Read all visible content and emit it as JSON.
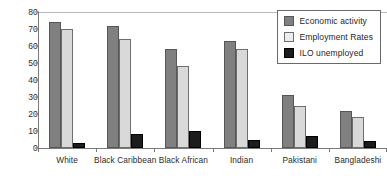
{
  "chart_data": {
    "type": "bar",
    "title": "",
    "xlabel": "",
    "ylabel": "Percentage",
    "ylim": [
      0,
      80
    ],
    "yticks": [
      0,
      10,
      20,
      30,
      40,
      50,
      60,
      70,
      80
    ],
    "grid": false,
    "legend_position": "top-right",
    "categories": [
      "White",
      "Black Caribbean",
      "Black African",
      "Indian",
      "Pakistani",
      "Bangladeshi"
    ],
    "series": [
      {
        "name": "Economic activity",
        "color": "#808080",
        "values": [
          74,
          72,
          58,
          63,
          31,
          22
        ]
      },
      {
        "name": "Employment Rates",
        "color": "#d9d9d9",
        "values": [
          70,
          64,
          48,
          58,
          25,
          18
        ]
      },
      {
        "name": "ILO unemployed",
        "color": "#1c1c1c",
        "values": [
          3,
          8,
          10,
          5,
          7,
          4
        ]
      }
    ]
  },
  "legend": {
    "items": [
      {
        "label": "Economic activity"
      },
      {
        "label": "Employment Rates"
      },
      {
        "label": "ILO unemployed"
      }
    ]
  }
}
